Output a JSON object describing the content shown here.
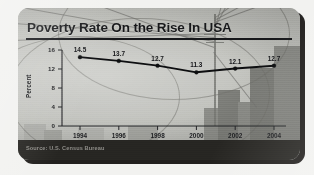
{
  "card": {
    "title": "Poverty Rate On the Rise In USA",
    "source": "Source: U.S. Census Bureau",
    "accent_color": "#0d0e10",
    "card_bg": "#b9bab5",
    "footer_bg": "#262522"
  },
  "chart_data": {
    "type": "line",
    "title": "Poverty Rate On the Rise In USA",
    "xlabel": "",
    "ylabel": "Percent",
    "categories": [
      "1994",
      "1996",
      "1998",
      "2000",
      "2002",
      "2004"
    ],
    "values": [
      14.5,
      13.7,
      12.7,
      11.3,
      12.1,
      12.7
    ],
    "point_labels": [
      "14.5",
      "13.7",
      "12.7",
      "11.3",
      "12.1",
      "12.7"
    ],
    "ytick_labels": [
      "16",
      "12",
      "8",
      "4",
      "0"
    ],
    "ytick_values": [
      16,
      12,
      8,
      4,
      0
    ],
    "ylim": [
      0,
      16
    ],
    "grid": false,
    "legend": false,
    "series": [
      {
        "name": "Poverty Rate",
        "values": [
          14.5,
          13.7,
          12.7,
          11.3,
          12.1,
          12.7
        ]
      }
    ],
    "source": "Source: U.S. Census Bureau"
  }
}
